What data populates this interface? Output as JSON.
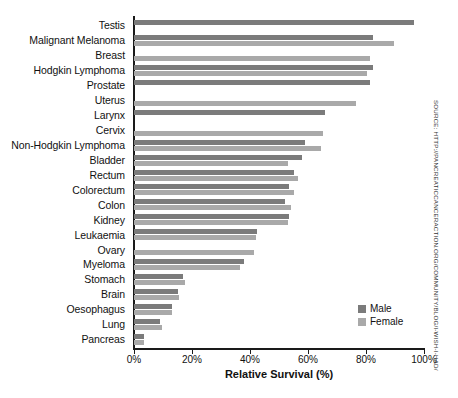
{
  "chart_data": {
    "type": "bar",
    "orientation": "horizontal",
    "title": "",
    "xlabel": "Relative Survival (%)",
    "ylabel": "",
    "xlim": [
      0,
      100
    ],
    "xticks": [
      "0%",
      "20%",
      "40%",
      "60%",
      "80%",
      "100%"
    ],
    "xtick_values": [
      0,
      20,
      40,
      60,
      80,
      100
    ],
    "grid": false,
    "legend_position": "bottom-right",
    "categories": [
      "Testis",
      "Malignant Melanoma",
      "Breast",
      "Hodgkin Lymphoma",
      "Prostate",
      "Uterus",
      "Larynx",
      "Cervix",
      "Non-Hodgkin Lymphoma",
      "Bladder",
      "Rectum",
      "Colorectum",
      "Colon",
      "Kidney",
      "Leukaemia",
      "Ovary",
      "Myeloma",
      "Stomach",
      "Brain",
      "Oesophagus",
      "Lung",
      "Pancreas"
    ],
    "series": [
      {
        "name": "Male",
        "color": "#7b7b7b",
        "values": [
          96.5,
          82.5,
          null,
          82.5,
          81.5,
          null,
          66,
          null,
          59,
          58,
          55,
          53.5,
          52,
          53.5,
          42.5,
          null,
          38,
          17,
          15,
          13,
          9,
          3.5
        ]
      },
      {
        "name": "Female",
        "color": "#a9a9a9",
        "values": [
          null,
          89.5,
          81.5,
          80.5,
          null,
          76.5,
          null,
          65,
          64.5,
          53,
          56.5,
          55,
          54,
          53,
          42,
          41.5,
          36.5,
          17.5,
          15.5,
          13,
          9.5,
          3.5
        ]
      }
    ]
  },
  "legend": {
    "items": [
      {
        "label": "Male",
        "color": "#7b7b7b"
      },
      {
        "label": "Female",
        "color": "#a9a9a9"
      }
    ]
  },
  "source_note": "SOURCE: HTTP://PANCREATICCANCERACTION.ORG/COMMUNITY/BLOG/I-WISH-I-HAD/"
}
